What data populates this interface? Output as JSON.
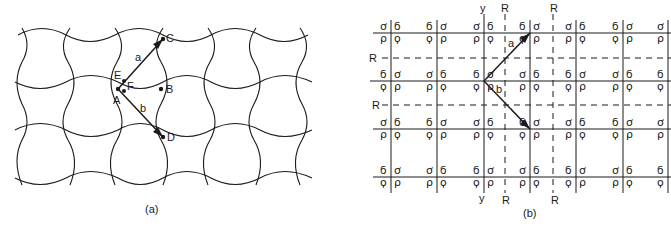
{
  "panel_a": {
    "caption": "(a)",
    "points": {
      "A": "A",
      "B": "B",
      "C": "C",
      "D": "D",
      "E": "E",
      "F": "F"
    },
    "vectors": {
      "a": "a",
      "b": "b"
    },
    "description": "Tessellation of curved interlocking tiles with lattice vectors a (A to C) and b (A to D)"
  },
  "panel_b": {
    "caption": "(b)",
    "axis_labels": {
      "y_top": "y",
      "y_bottom": "y",
      "R_top_1": "R",
      "R_top_2": "R",
      "R_bottom_1": "R",
      "R_bottom_2": "R",
      "R_left_1": "R",
      "R_left_2": "R"
    },
    "vectors": {
      "a": "a",
      "b": "b"
    },
    "motif_glyphs": [
      "ϭ",
      "ơ",
      "ϙ",
      "ρ"
    ],
    "description": "Rectangular lattice with motif glyphs at each node, glide/mirror lines R shown dashed, y axis vertical"
  },
  "colors": {
    "line": "#1a1a1a",
    "background": "#ffffff"
  }
}
